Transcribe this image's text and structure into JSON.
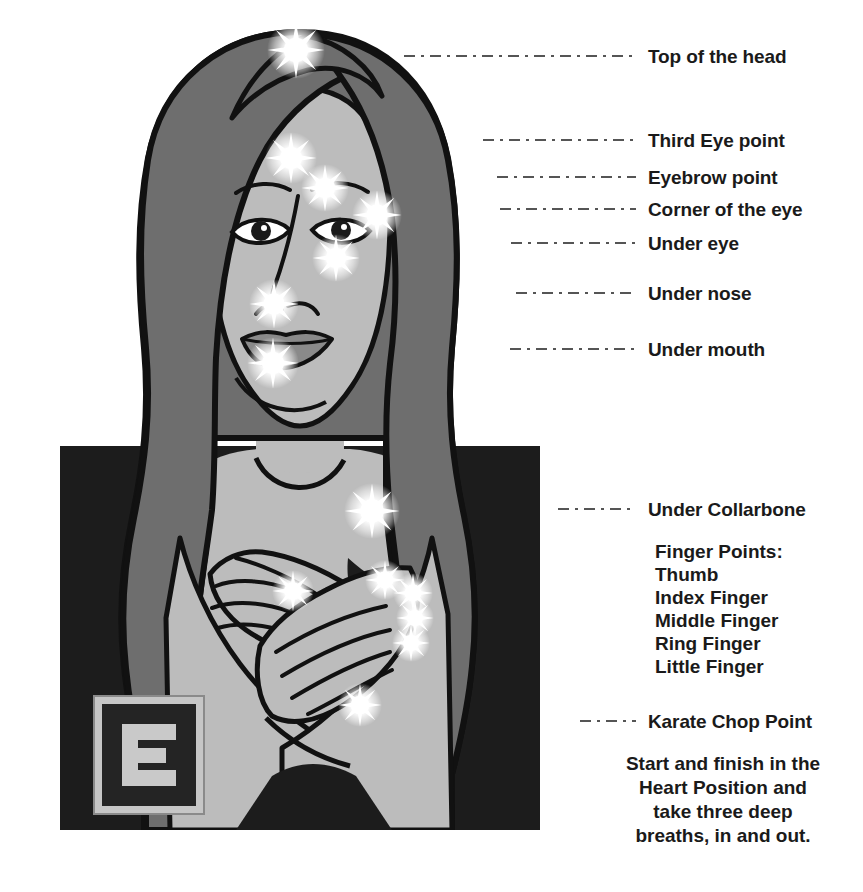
{
  "diagram": {
    "colors": {
      "background": "#ffffff",
      "skin": "#b9b9b9",
      "hair": "#6e6e6e",
      "clothing": "#1c1c1c",
      "outline": "#111111",
      "sparkle": "#ffffff",
      "text": "#1a1a1a",
      "leader_line": "#555555"
    }
  },
  "labels": [
    {
      "id": "top-of-head",
      "text": "Top of the head",
      "text_x": 648,
      "text_y": 46,
      "line_x": 404,
      "line_y": 55,
      "line_w": 232
    },
    {
      "id": "third-eye-point",
      "text": "Third Eye point",
      "text_x": 648,
      "text_y": 130,
      "line_x": 483,
      "line_y": 139,
      "line_w": 153
    },
    {
      "id": "eyebrow-point",
      "text": "Eyebrow point",
      "text_x": 648,
      "text_y": 167,
      "line_x": 497,
      "line_y": 176,
      "line_w": 139
    },
    {
      "id": "corner-of-eye",
      "text": "Corner of the eye",
      "text_x": 648,
      "text_y": 199,
      "line_x": 500,
      "line_y": 208,
      "line_w": 136
    },
    {
      "id": "under-eye",
      "text": "Under eye",
      "text_x": 648,
      "text_y": 233,
      "line_x": 511,
      "line_y": 242,
      "line_w": 125
    },
    {
      "id": "under-nose",
      "text": "Under nose",
      "text_x": 648,
      "text_y": 283,
      "line_x": 516,
      "line_y": 292,
      "line_w": 120
    },
    {
      "id": "under-mouth",
      "text": "Under mouth",
      "text_x": 648,
      "text_y": 339,
      "line_x": 510,
      "line_y": 348,
      "line_w": 126
    },
    {
      "id": "under-collarbone",
      "text": "Under Collarbone",
      "text_x": 648,
      "text_y": 499,
      "line_x": 558,
      "line_y": 508,
      "line_w": 78
    },
    {
      "id": "karate-chop",
      "text": "Karate Chop Point",
      "text_x": 648,
      "text_y": 711,
      "line_x": 580,
      "line_y": 720,
      "line_w": 56
    }
  ],
  "finger_points": {
    "heading": "Finger Points:",
    "items": [
      "Thumb",
      "Index Finger",
      "Middle Finger",
      "Ring Finger",
      "Little Finger"
    ]
  },
  "closing_note": {
    "lines": [
      "Start and finish in the",
      "Heart Position and",
      "take three deep",
      "breaths, in and out."
    ]
  },
  "logo": {
    "letter": "E"
  },
  "sparkles": [
    {
      "id": "sparkle-top-of-head",
      "x": 236,
      "y": 32,
      "r": 29
    },
    {
      "id": "sparkle-third-eye",
      "x": 231,
      "y": 140,
      "r": 26
    },
    {
      "id": "sparkle-eyebrow",
      "x": 265,
      "y": 170,
      "r": 24
    },
    {
      "id": "sparkle-corner-eye",
      "x": 317,
      "y": 197,
      "r": 25
    },
    {
      "id": "sparkle-under-eye",
      "x": 276,
      "y": 240,
      "r": 24
    },
    {
      "id": "sparkle-under-nose",
      "x": 214,
      "y": 286,
      "r": 25
    },
    {
      "id": "sparkle-under-mouth",
      "x": 213,
      "y": 345,
      "r": 26
    },
    {
      "id": "sparkle-collarbone",
      "x": 312,
      "y": 493,
      "r": 28
    },
    {
      "id": "sparkle-thumb",
      "x": 233,
      "y": 573,
      "r": 21
    },
    {
      "id": "sparkle-index",
      "x": 325,
      "y": 562,
      "r": 20
    },
    {
      "id": "sparkle-middle",
      "x": 353,
      "y": 575,
      "r": 20
    },
    {
      "id": "sparkle-ring",
      "x": 355,
      "y": 600,
      "r": 19
    },
    {
      "id": "sparkle-little",
      "x": 351,
      "y": 625,
      "r": 19
    },
    {
      "id": "sparkle-karate-chop",
      "x": 300,
      "y": 687,
      "r": 22
    }
  ]
}
